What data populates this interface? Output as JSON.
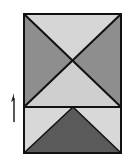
{
  "diagram": {
    "type": "quilt-block",
    "frame": {
      "x": 24,
      "y": 14,
      "w": 97,
      "h": 139
    },
    "divider_y": 107,
    "center": {
      "x": 73,
      "y": 61
    },
    "colors": {
      "top_triangle": "#d6d6d6",
      "left_triangle": "#8e8e8e",
      "right_triangle": "#8e8e8e",
      "middle_triangle": "#cfcfcf",
      "bottom_left_corner": "#d8d8d8",
      "bottom_right_corner": "#d8d8d8",
      "bottom_triangle": "#5a5a5a",
      "stroke": "#111111"
    },
    "arrow": {
      "direction": "up",
      "x": 13,
      "y_top": 94,
      "y_bottom": 122
    }
  }
}
